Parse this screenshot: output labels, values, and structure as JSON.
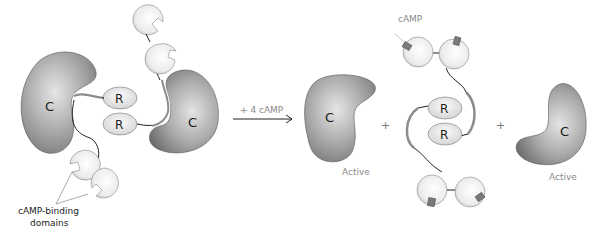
{
  "diagram": {
    "title": "",
    "labels": {
      "catalytic": "C",
      "regulatory": "R",
      "camp_binding_domains_line1": "cAMP-binding",
      "camp_binding_domains_line2": "domains",
      "arrow_label": "+ 4 cAMP",
      "camp": "cAMP",
      "active": "Active",
      "plus": "+"
    },
    "colors": {
      "catalytic_dark": "#6e6e6e",
      "catalytic_light": "#d8d8d8",
      "domain_light": "#f2f2f2",
      "domain_dark": "#c8c8c8",
      "linker": "#222222",
      "linker_thick": "#8c8c8c",
      "label_gray": "#8a8a8a",
      "camp_fill": "#7a7a7a"
    },
    "left_complex": {
      "name": "Inactive PKA holoenzyme (R2C2)",
      "catalytic_subunits": 2,
      "regulatory_subunits": 2,
      "camp_binding_domains": 4
    },
    "right_products": [
      {
        "name": "Active catalytic subunit 1",
        "label": "Active"
      },
      {
        "name": "Regulatory dimer with bound cAMP",
        "camp_bound": 4
      },
      {
        "name": "Active catalytic subunit 2",
        "label": "Active"
      }
    ]
  }
}
